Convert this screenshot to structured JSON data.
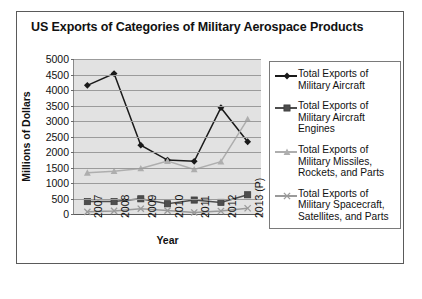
{
  "chart_data": {
    "type": "line",
    "title": "US Exports of Categories of Military Aerospace Products",
    "xlabel": "Year",
    "ylabel": "Millions of Dollars",
    "categories": [
      "2007",
      "2008",
      "2009",
      "2010",
      "2011",
      "2012",
      "2013 (P)"
    ],
    "ylim": [
      0,
      5000
    ],
    "ytick_values": [
      0,
      500,
      1000,
      1500,
      2000,
      2500,
      3000,
      3500,
      4000,
      4500,
      5000
    ],
    "ytick_labels": [
      "0",
      "500",
      "1000",
      "1500",
      "2000",
      "2500",
      "3000",
      "3500",
      "4000",
      "4500",
      "5000"
    ],
    "grid": "horizontal",
    "legend_position": "right",
    "plot_background": "#e2e2e2",
    "series": [
      {
        "name": "Total Exports of Military Aircraft",
        "marker": "diamond",
        "color": "#1a1a1a",
        "values": [
          4150,
          4530,
          2220,
          1740,
          1700,
          3430,
          2330
        ]
      },
      {
        "name": "Total Exports of Military Aircraft Engines",
        "marker": "square",
        "color": "#4d4d4d",
        "values": [
          400,
          400,
          490,
          330,
          450,
          375,
          620
        ]
      },
      {
        "name": "Total Exports of Military Missiles, Rockets, and Parts",
        "marker": "triangle",
        "color": "#aeaeae",
        "values": [
          1330,
          1380,
          1470,
          1710,
          1440,
          1690,
          3060
        ]
      },
      {
        "name": "Total Exports of Military Spacecraft, Satellites, and Parts",
        "marker": "cross",
        "color": "#9a9a9a",
        "values": [
          70,
          100,
          170,
          110,
          50,
          95,
          185
        ]
      }
    ]
  },
  "legend": {
    "items": [
      {
        "label": "Total Exports of Military Aircraft"
      },
      {
        "label": "Total Exports of Military Aircraft Engines"
      },
      {
        "label": "Total Exports of Military Missiles, Rockets, and Parts"
      },
      {
        "label": "Total Exports of Military Spacecraft, Satellites, and Parts"
      }
    ]
  }
}
